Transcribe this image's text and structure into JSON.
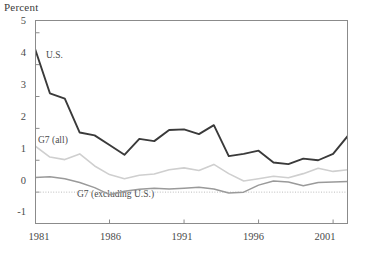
{
  "chart_data": {
    "type": "line",
    "title": "",
    "ylabel": "Percent",
    "xlabel": "",
    "ylim": [
      -1,
      5.4
    ],
    "xlim": [
      1981,
      2002
    ],
    "grid": false,
    "zero_line": true,
    "legend_position": "inline-annotations",
    "y_ticks": [
      "5",
      "4",
      "3",
      "2",
      "1",
      "0",
      "-1"
    ],
    "y_tick_values": [
      5,
      4,
      3,
      2,
      1,
      0,
      -1
    ],
    "x_ticks": [
      "1981",
      "1986",
      "1991",
      "1996",
      "2001"
    ],
    "x_tick_values": [
      1981,
      1986,
      1991,
      1996,
      2001
    ],
    "x": [
      1981,
      1982,
      1983,
      1984,
      1985,
      1986,
      1987,
      1988,
      1989,
      1990,
      1991,
      1992,
      1993,
      1994,
      1995,
      1996,
      1997,
      1998,
      1999,
      2000,
      2001,
      2002
    ],
    "series": [
      {
        "name": "U.S.",
        "color": "#3a3a3a",
        "width": 1.9,
        "values": [
          4.5,
          3.1,
          2.93,
          1.87,
          1.78,
          1.48,
          1.17,
          1.67,
          1.6,
          1.95,
          1.97,
          1.82,
          2.1,
          1.13,
          1.2,
          1.3,
          0.93,
          0.88,
          1.05,
          1.0,
          1.2,
          1.77
        ]
      },
      {
        "name": "G7 (all)",
        "color": "#cfcfcf",
        "width": 1.6,
        "values": [
          1.45,
          1.1,
          1.02,
          1.2,
          0.82,
          0.55,
          0.42,
          0.53,
          0.57,
          0.7,
          0.76,
          0.68,
          0.87,
          0.58,
          0.35,
          0.42,
          0.5,
          0.45,
          0.58,
          0.75,
          0.65,
          0.7
        ]
      },
      {
        "name": "G7 (excluding U.S.)",
        "color": "#9a9a9a",
        "width": 1.5,
        "values": [
          0.46,
          0.48,
          0.42,
          0.3,
          0.14,
          -0.08,
          0.03,
          0.09,
          0.12,
          0.1,
          0.12,
          0.15,
          0.1,
          -0.03,
          0.0,
          0.22,
          0.35,
          0.32,
          0.2,
          0.3,
          0.32,
          0.33
        ]
      }
    ],
    "annotations": [
      {
        "text": "U.S.",
        "series": "U.S."
      },
      {
        "text": "G7 (all)",
        "series": "G7 (all)"
      },
      {
        "text": "G7 (excluding U.S.)",
        "series": "G7 (excluding U.S.)"
      }
    ]
  },
  "colors": {
    "axis": "#8b8b8b",
    "text": "#4a4a4a",
    "zero_line": "#bcbcbc",
    "background": "#ffffff"
  }
}
